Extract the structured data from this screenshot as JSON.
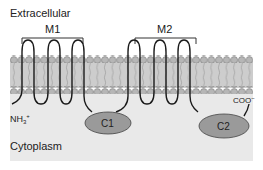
{
  "labels": {
    "extracellular": "Extracellular",
    "cytoplasm": "Cytoplasm",
    "m1": "M1",
    "m2": "M2",
    "c1": "C1",
    "c2": "C2",
    "n_terminus": "NH",
    "n_sub": "3",
    "n_sup": "+",
    "c_terminus": "COO",
    "c_sup": "−"
  },
  "colors": {
    "cytoplasm_bg": "#e9e9e9",
    "membrane_fill": "#c8c8c8",
    "head": "#b4b4b4",
    "domain": "#9a9a9a",
    "line": "#1a1a1a"
  }
}
